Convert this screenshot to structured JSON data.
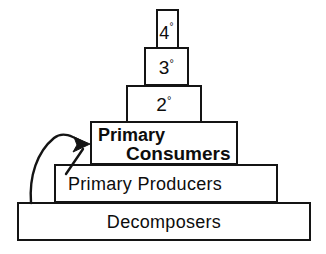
{
  "diagram": {
    "type": "pyramid-diagram",
    "background_color": "#ffffff",
    "line_color": "#141414",
    "text_color": "#0d0d0d",
    "levels": [
      {
        "id": "quaternary",
        "label": "4",
        "degree_symbol": "°",
        "full_label": "4°",
        "order": 6,
        "box": {
          "x": 156,
          "y": 9,
          "width": 23,
          "height": 40
        }
      },
      {
        "id": "tertiary",
        "label": "3",
        "degree_symbol": "°",
        "full_label": "3°",
        "order": 5,
        "box": {
          "x": 144,
          "y": 47,
          "width": 45,
          "height": 39
        }
      },
      {
        "id": "secondary",
        "label": "2",
        "degree_symbol": "°",
        "full_label": "2°",
        "order": 4,
        "box": {
          "x": 126,
          "y": 85,
          "width": 76,
          "height": 38
        }
      },
      {
        "id": "primary-consumers",
        "label_line_one": "Primary",
        "label_line_two": "Consumers",
        "full_label": "Primary Consumers",
        "order": 3,
        "box": {
          "x": 90,
          "y": 121,
          "width": 148,
          "height": 44
        }
      },
      {
        "id": "primary-producers",
        "label": "Primary  Producers",
        "full_label": "Primary Producers",
        "order": 2,
        "box": {
          "x": 54,
          "y": 164,
          "width": 224,
          "height": 39
        }
      },
      {
        "id": "decomposers",
        "label": "Decomposers",
        "full_label": "Decomposers",
        "order": 1,
        "box": {
          "x": 17,
          "y": 202,
          "width": 294,
          "height": 39
        }
      }
    ],
    "arrows": [
      {
        "id": "decomposers-to-consumers",
        "description": "long curved arrow from lower-left rising to the left edge of the Primary Consumers box",
        "start": {
          "x": 31,
          "y": 203
        },
        "end": {
          "x": 88,
          "y": 143
        }
      },
      {
        "id": "producers-to-consumers",
        "description": "short straight arrow rising to the left edge of the Primary Consumers box",
        "start": {
          "x": 67,
          "y": 173
        },
        "end": {
          "x": 85,
          "y": 148
        }
      }
    ]
  }
}
